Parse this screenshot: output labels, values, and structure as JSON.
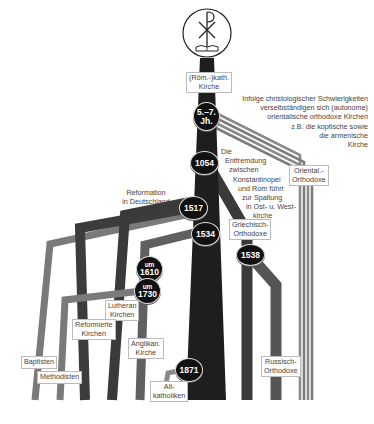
{
  "diagram": {
    "type": "church-history-tree",
    "colors": {
      "trunk": "#1e1e1e",
      "dark_branch": "#3a3a3a",
      "mid_branch": "#555555",
      "light_branch": "#7a7a7a",
      "oriental_stripes": "#808080",
      "node_fill": "#111111",
      "label_text": "#444444"
    },
    "root": {
      "icon": "chi-rho-bible-icon",
      "label": "(Röm.-)kath.\nKirche",
      "label_line1": "(Röm.-)kath.",
      "label_line2": "Kirche"
    },
    "nodes": [
      {
        "id": "n_5_7",
        "line1": "5.–7.",
        "line2": "Jh."
      },
      {
        "id": "n_1054",
        "line1": "1054"
      },
      {
        "id": "n_1517",
        "line1": "1517"
      },
      {
        "id": "n_1534",
        "line1": "1534"
      },
      {
        "id": "n_1610",
        "line1": "um",
        "line2": "1610"
      },
      {
        "id": "n_1730",
        "line1": "um",
        "line2": "1730"
      },
      {
        "id": "n_1538",
        "line1": "1538"
      },
      {
        "id": "n_1871",
        "line1": "1871"
      }
    ],
    "annotations": {
      "oriental_note": [
        "Infolge christologischer Schwierigkeiten",
        "verselbständigen sich (autonome)",
        "orientalische orthodoxe Kirchen",
        "z.B. die koptische sowie",
        "die armenische",
        "Kirche"
      ],
      "schism_note": [
        "Die",
        "Entfremdung",
        "zwischen",
        "Konstantinopel",
        "und Rom führt",
        "zur Spaltung",
        "in Ost- u. West-",
        "kirche"
      ],
      "reformation_note": [
        "Reformation",
        "in Deutschland"
      ]
    },
    "branch_labels": {
      "oriental": [
        "Oriental.-",
        "Orthodoxe"
      ],
      "greek": [
        "Griechisch-",
        "Orthodoxe"
      ],
      "russian": [
        "Russisch-",
        "Orthodoxe"
      ],
      "lutheran": [
        "Lutheran",
        "Kirchen"
      ],
      "reformed": [
        "Reformierte",
        "Kirchen"
      ],
      "anglican": [
        "Anglikan.",
        "Kirche"
      ],
      "baptists": [
        "Baptisten"
      ],
      "methodists": [
        "Methodisten"
      ],
      "old_catholics": [
        "Alt-",
        "katholiken"
      ]
    }
  }
}
